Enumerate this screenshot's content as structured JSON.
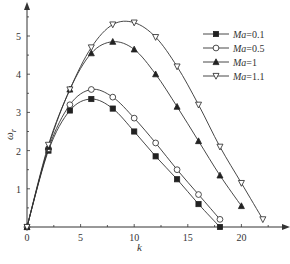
{
  "chart_data": {
    "type": "line",
    "title": "",
    "xlabel": "k",
    "ylabel": "ω_r",
    "xlim": [
      0,
      24
    ],
    "ylim": [
      0,
      5.8
    ],
    "xticks": [
      0,
      5,
      10,
      15,
      20
    ],
    "yticks": [
      1,
      2,
      3,
      4,
      5
    ],
    "grid": false,
    "legend_position": "upper right",
    "series": [
      {
        "name": "Ma=0.1",
        "marker": "filled-square",
        "x": [
          0,
          2,
          4,
          6,
          8,
          10,
          12,
          14,
          16,
          18
        ],
        "y": [
          0,
          2.0,
          3.05,
          3.35,
          3.1,
          2.5,
          1.85,
          1.25,
          0.6,
          0.0
        ]
      },
      {
        "name": "Ma=0.5",
        "marker": "open-circle",
        "x": [
          0,
          2,
          4,
          6,
          8,
          10,
          12,
          14,
          16,
          18
        ],
        "y": [
          0,
          2.05,
          3.2,
          3.6,
          3.4,
          2.85,
          2.2,
          1.5,
          0.85,
          0.2
        ]
      },
      {
        "name": "Ma=1",
        "marker": "filled-triangle-up",
        "x": [
          0,
          2,
          4,
          6,
          8,
          10,
          12,
          14,
          16,
          18,
          20
        ],
        "y": [
          0,
          2.1,
          3.6,
          4.55,
          4.85,
          4.65,
          4.0,
          3.15,
          2.25,
          1.35,
          0.55
        ]
      },
      {
        "name": "Ma=1.1",
        "marker": "open-triangle-down",
        "x": [
          0,
          2,
          4,
          6,
          8,
          10,
          12,
          14,
          16,
          18,
          20,
          22
        ],
        "y": [
          0,
          2.15,
          3.6,
          4.7,
          5.3,
          5.35,
          4.97,
          4.2,
          3.2,
          2.1,
          1.15,
          0.2
        ]
      }
    ]
  },
  "legend": {
    "items": [
      "Ma=0.1",
      "Ma=0.5",
      "Ma=1",
      "Ma=1.1"
    ]
  },
  "axes": {
    "xlabel": "k",
    "ylabel_main": "ω",
    "ylabel_sub": "r",
    "xtick_labels": [
      "0",
      "5",
      "10",
      "15",
      "20"
    ],
    "ytick_labels": [
      "1",
      "2",
      "3",
      "4",
      "5"
    ]
  }
}
